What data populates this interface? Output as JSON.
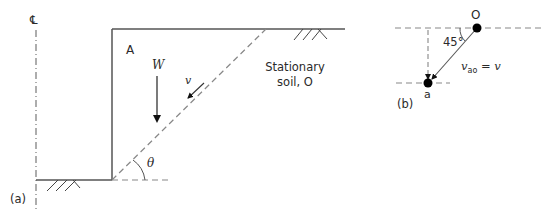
{
  "panel_a": {
    "caption": "(a)",
    "centerline_symbol": "℄",
    "block_label": "A",
    "weight_label": "W",
    "velocity_label": "v",
    "angle_label": "θ",
    "soil_label_line1": "Stationary",
    "soil_label_line2": "soil, O"
  },
  "panel_b": {
    "caption": "(b)",
    "origin_label": "O",
    "point_label": "a",
    "angle_label": "45°",
    "velocity_label_main": "v",
    "velocity_label_sub": "ao",
    "velocity_label_rhs": " = v"
  },
  "colors": {
    "line": "#555555",
    "text": "#2a2a2a",
    "dot": "#000000"
  }
}
